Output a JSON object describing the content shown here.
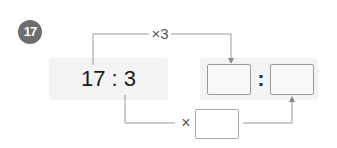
{
  "problem": {
    "number": "17",
    "ratio": {
      "left": "17",
      "separator": ":",
      "right": "3",
      "text": "17 : 3"
    },
    "top_operation": "×3",
    "bottom_operation": "×",
    "answer": {
      "first_value": "",
      "separator": ":",
      "second_value": "",
      "multiplier_value": ""
    }
  },
  "colors": {
    "badge": "#6e6e6e",
    "panel": "#f3f3f3",
    "lines": "#9a9a9a"
  }
}
